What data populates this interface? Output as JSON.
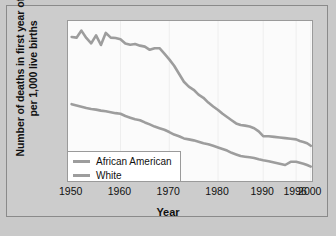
{
  "chart_data": {
    "type": "line",
    "title": "",
    "xlabel": "Year",
    "ylabel": "Number of deaths in first year of life per 1,000 live births",
    "xlim": [
      1950,
      2000
    ],
    "ylim": [
      0,
      50
    ],
    "grid": "vertical-faint",
    "legend_position": "bottom-left-inside",
    "x_tick_labels": [
      "1950",
      "1960",
      "1970",
      "1980",
      "1990",
      "1996",
      "2000"
    ],
    "x_tick_values": [
      1950,
      1960,
      1970,
      1980,
      1990,
      1996,
      2000
    ],
    "y_tick_labels": [
      "0",
      "5",
      "10",
      "15",
      "20",
      "25",
      "30",
      "35",
      "40",
      "45",
      "50"
    ],
    "y_tick_values": [
      0,
      5,
      10,
      15,
      20,
      25,
      30,
      35,
      40,
      45,
      50
    ],
    "series": [
      {
        "name": "African American",
        "color": "#9d9d9d",
        "x": [
          1950,
          1951,
          1952,
          1953,
          1954,
          1955,
          1956,
          1957,
          1958,
          1959,
          1960,
          1961,
          1962,
          1963,
          1964,
          1965,
          1966,
          1967,
          1968,
          1969,
          1970,
          1971,
          1972,
          1973,
          1974,
          1975,
          1976,
          1977,
          1978,
          1979,
          1980,
          1981,
          1982,
          1983,
          1984,
          1985,
          1986,
          1987,
          1988,
          1989,
          1990,
          1991,
          1992,
          1993,
          1994,
          1995,
          1996,
          1997,
          1998,
          1999,
          2000
        ],
        "values": [
          45.0,
          44.8,
          47.0,
          44.7,
          43.0,
          45.5,
          42.5,
          46.3,
          44.8,
          44.7,
          44.3,
          43.0,
          42.6,
          42.8,
          42.3,
          42.0,
          41.0,
          41.5,
          41.5,
          39.8,
          38.0,
          36.0,
          33.5,
          31.0,
          29.5,
          28.5,
          27.0,
          26.0,
          24.5,
          23.3,
          22.2,
          21.0,
          20.0,
          19.0,
          18.0,
          17.5,
          17.3,
          17.0,
          16.5,
          15.5,
          14.0,
          14.0,
          13.8,
          13.6,
          13.4,
          13.2,
          13.0,
          12.5,
          12.2,
          11.8,
          11.0
        ]
      },
      {
        "name": "White",
        "color": "#9d9d9d",
        "x": [
          1950,
          1951,
          1952,
          1953,
          1954,
          1955,
          1956,
          1957,
          1958,
          1959,
          1960,
          1961,
          1962,
          1963,
          1964,
          1965,
          1966,
          1967,
          1968,
          1969,
          1970,
          1971,
          1972,
          1973,
          1974,
          1975,
          1976,
          1977,
          1978,
          1979,
          1980,
          1981,
          1982,
          1983,
          1984,
          1985,
          1986,
          1987,
          1988,
          1989,
          1990,
          1991,
          1992,
          1993,
          1994,
          1995,
          1996,
          1997,
          1998,
          1999,
          2000
        ],
        "values": [
          24.0,
          23.6,
          23.2,
          22.8,
          22.5,
          22.3,
          22.0,
          21.8,
          21.5,
          21.2,
          21.0,
          20.3,
          19.8,
          19.3,
          19.0,
          18.3,
          17.7,
          17.0,
          16.5,
          16.0,
          15.3,
          14.5,
          14.0,
          13.3,
          13.0,
          12.7,
          12.3,
          11.8,
          11.5,
          11.0,
          10.5,
          10.0,
          9.5,
          8.8,
          8.3,
          7.8,
          7.6,
          7.4,
          7.2,
          6.8,
          6.5,
          6.2,
          5.8,
          5.4,
          5.0,
          6.0,
          6.0,
          5.7,
          5.4,
          5.0,
          4.5
        ]
      }
    ]
  },
  "axes": {
    "x_title": "Year",
    "y_title": "Number of deaths in first year of life per 1,000 live births"
  },
  "legend": {
    "entries": [
      {
        "label": "African American"
      },
      {
        "label": "White"
      }
    ]
  },
  "colors": {
    "figure_background": "#c9c9c9",
    "panel_background": "#cccccc",
    "plot_background": "#fbfbfb",
    "line": "#9d9d9d",
    "axis": "#9a9a9a",
    "text": "#111111"
  }
}
